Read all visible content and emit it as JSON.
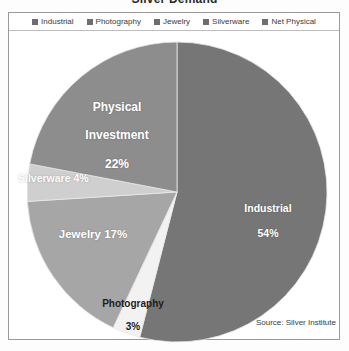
{
  "chart_data": {
    "type": "pie",
    "title": "Silver Demand",
    "source_note": "Source: Silver Institute",
    "categories": [
      "Industrial",
      "Photography",
      "Jewelry",
      "Silverware",
      "Net Physical"
    ],
    "values": [
      54,
      3,
      17,
      4,
      22
    ],
    "unit": "%",
    "legend_position": "top",
    "grid": false,
    "slice_labels": [
      {
        "name": "Industrial",
        "text": "Industrial",
        "value": "54%",
        "color": "#767676",
        "text_color": "#ffffff"
      },
      {
        "name": "Photography",
        "text": "Photography",
        "value": "3%",
        "color": "#f2f2f2",
        "text_color": "#1c1c1c"
      },
      {
        "name": "Jewelry",
        "text": "Jewelry 17%",
        "value": "17%",
        "color": "#a6a6a6",
        "text_color": "#ffffff"
      },
      {
        "name": "Silverware",
        "text": "Silverware 4%",
        "value": "4%",
        "color": "#cfcfcf",
        "text_color": "#ffffff"
      },
      {
        "name": "Net Physical",
        "text": "Physical\nInvestment",
        "value": "22%",
        "color": "#8d8d8d",
        "text_color": "#ffffff"
      }
    ]
  },
  "chart": {
    "title": "Silver Demand",
    "source_note": "Source: Silver Institute"
  },
  "legend": {
    "items": [
      {
        "label": "Industrial",
        "swatch": "#6e6e6e",
        "icon": "legend-swatch-icon"
      },
      {
        "label": "Photography",
        "swatch": "#6e6e6e",
        "icon": "legend-swatch-icon"
      },
      {
        "label": "Jewelry",
        "swatch": "#6e6e6e",
        "icon": "legend-swatch-icon"
      },
      {
        "label": "Silverware",
        "swatch": "#6e6e6e",
        "icon": "legend-swatch-icon"
      },
      {
        "label": "Net Physical",
        "swatch": "#6e6e6e",
        "icon": "legend-swatch-icon"
      }
    ]
  },
  "labels": {
    "physical_line1": "Physical",
    "physical_line2": "Investment",
    "physical_value": "22%",
    "silverware": "Silverware 4%",
    "jewelry": "Jewelry 17%",
    "photography_name": "Photography",
    "photography_value": "3%",
    "industrial_name": "Industrial",
    "industrial_value": "54%"
  }
}
